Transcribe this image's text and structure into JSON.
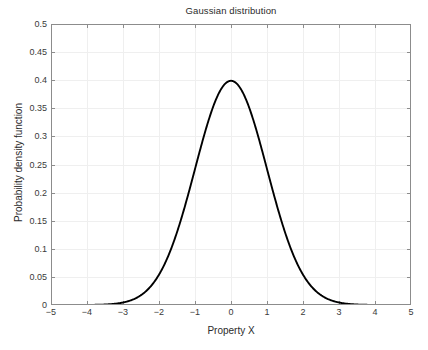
{
  "chart_data": {
    "type": "line",
    "title": "Gaussian distribution",
    "xlabel": "Property X",
    "ylabel": "Probability density function",
    "xlim": [
      -5,
      5
    ],
    "ylim": [
      0,
      0.5
    ],
    "grid": true,
    "legend": null,
    "legend_position": "none",
    "xticks": [
      -5,
      -4,
      -3,
      -2,
      -1,
      0,
      1,
      2,
      3,
      4,
      5
    ],
    "xtick_labels": [
      "-5",
      "-4",
      "-3",
      "-2",
      "-1",
      "0",
      "1",
      "2",
      "3",
      "4",
      "5"
    ],
    "yticks": [
      0,
      0.05,
      0.1,
      0.15,
      0.2,
      0.25,
      0.3,
      0.35,
      0.4,
      0.45,
      0.5
    ],
    "ytick_labels": [
      "0",
      "0.05",
      "0.1",
      "0.15",
      "0.2",
      "0.25",
      "0.3",
      "0.35",
      "0.4",
      "0.45",
      "0.5"
    ],
    "series": [
      {
        "name": "Gaussian PDF (mu=0, sigma=1)",
        "color": "#000000",
        "line_width": 1.9,
        "mu": 0,
        "sigma": 1,
        "peak_value": 0.3989,
        "peak_x": 0,
        "x": [
          -5.0,
          -4.8,
          -4.6,
          -4.4,
          -4.2,
          -4.0,
          -3.8,
          -3.6,
          -3.4,
          -3.2,
          -3.0,
          -2.8,
          -2.6,
          -2.4,
          -2.2,
          -2.0,
          -1.8,
          -1.6,
          -1.4,
          -1.2,
          -1.0,
          -0.8,
          -0.6,
          -0.4,
          -0.2,
          0.0,
          0.2,
          0.4,
          0.6,
          0.8,
          1.0,
          1.2,
          1.4,
          1.6,
          1.8,
          2.0,
          2.2,
          2.4,
          2.6,
          2.8,
          3.0,
          3.2,
          3.4,
          3.6,
          3.8,
          4.0,
          4.2,
          4.4,
          4.6,
          4.8,
          5.0
        ],
        "y": [
          1.5e-06,
          4e-06,
          1.02e-05,
          2.49e-05,
          5.89e-05,
          0.0001338,
          0.0002919,
          0.0006119,
          0.0012322,
          0.0023841,
          0.0044318,
          0.0079155,
          0.013583,
          0.0223945,
          0.0354746,
          0.053991,
          0.0789502,
          0.1109208,
          0.1497275,
          0.1941861,
          0.2419707,
          0.2896916,
          0.3332246,
          0.3682701,
          0.3910427,
          0.3989423,
          0.3910427,
          0.3682701,
          0.3332246,
          0.2896916,
          0.2419707,
          0.1941861,
          0.1497275,
          0.1109208,
          0.0789502,
          0.053991,
          0.0354746,
          0.0223945,
          0.013583,
          0.0079155,
          0.0044318,
          0.0023841,
          0.0012322,
          0.0006119,
          0.0002919,
          0.0001338,
          5.89e-05,
          2.49e-05,
          1.02e-05,
          4e-06,
          1.5e-06
        ]
      }
    ]
  },
  "style": {
    "axis_color": "#8c8c8c",
    "grid_color": "#efefef",
    "curve_color": "#000000",
    "text_color": "#2b2b2b",
    "background": "#ffffff"
  }
}
